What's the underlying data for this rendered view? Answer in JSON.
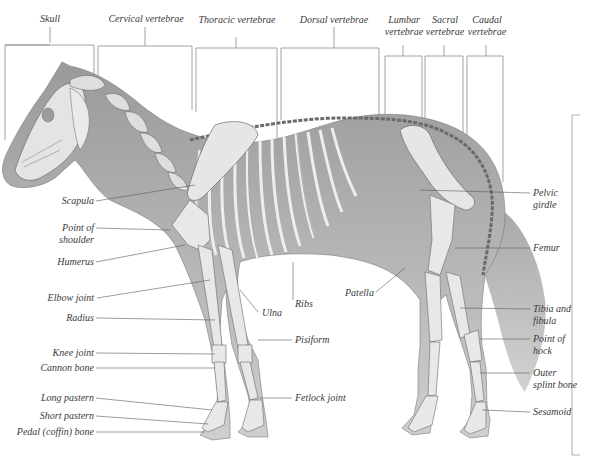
{
  "diagram": {
    "top_labels": [
      {
        "id": "skull",
        "text": "Skull"
      },
      {
        "id": "cervical",
        "text": "Cervical vertebrae"
      },
      {
        "id": "thoracic",
        "text": "Thoracic vertebrae"
      },
      {
        "id": "dorsal",
        "text": "Dorsal vertebrae"
      },
      {
        "id": "lumbar",
        "line1": "Lumbar",
        "line2": "vertebrae"
      },
      {
        "id": "sacral",
        "line1": "Sacral",
        "line2": "vertebrae"
      },
      {
        "id": "caudal",
        "line1": "Caudal",
        "line2": "vertebrae"
      }
    ],
    "left_labels": [
      {
        "id": "scapula",
        "text": "Scapula"
      },
      {
        "id": "point-of-shoulder",
        "line1": "Point of",
        "line2": "shoulder"
      },
      {
        "id": "humerus",
        "text": "Humerus"
      },
      {
        "id": "elbow-joint",
        "text": "Elbow joint"
      },
      {
        "id": "radius",
        "text": "Radius"
      },
      {
        "id": "knee-joint",
        "text": "Knee joint"
      },
      {
        "id": "cannon-bone",
        "text": "Cannon bone"
      },
      {
        "id": "long-pastern",
        "text": "Long pastern"
      },
      {
        "id": "short-pastern",
        "text": "Short pastern"
      },
      {
        "id": "pedal-bone",
        "text": "Pedal (coffin) bone"
      }
    ],
    "middle_labels": [
      {
        "id": "ulna",
        "text": "Ulna"
      },
      {
        "id": "ribs",
        "text": "Ribs"
      },
      {
        "id": "patella",
        "text": "Patella"
      },
      {
        "id": "pisiform",
        "text": "Pisiform"
      },
      {
        "id": "fetlock-joint",
        "text": "Fetlock joint"
      }
    ],
    "right_labels": [
      {
        "id": "pelvic-girdle",
        "line1": "Pelvic",
        "line2": "girdle"
      },
      {
        "id": "femur",
        "text": "Femur"
      },
      {
        "id": "tibia-fibula",
        "line1": "Tibia and",
        "line2": "fibula"
      },
      {
        "id": "point-of-hock",
        "line1": "Point of",
        "line2": "hock"
      },
      {
        "id": "outer-splint-bone",
        "line1": "Outer",
        "line2": "splint bone"
      },
      {
        "id": "sesamoid",
        "text": "Sesamoid"
      }
    ]
  }
}
